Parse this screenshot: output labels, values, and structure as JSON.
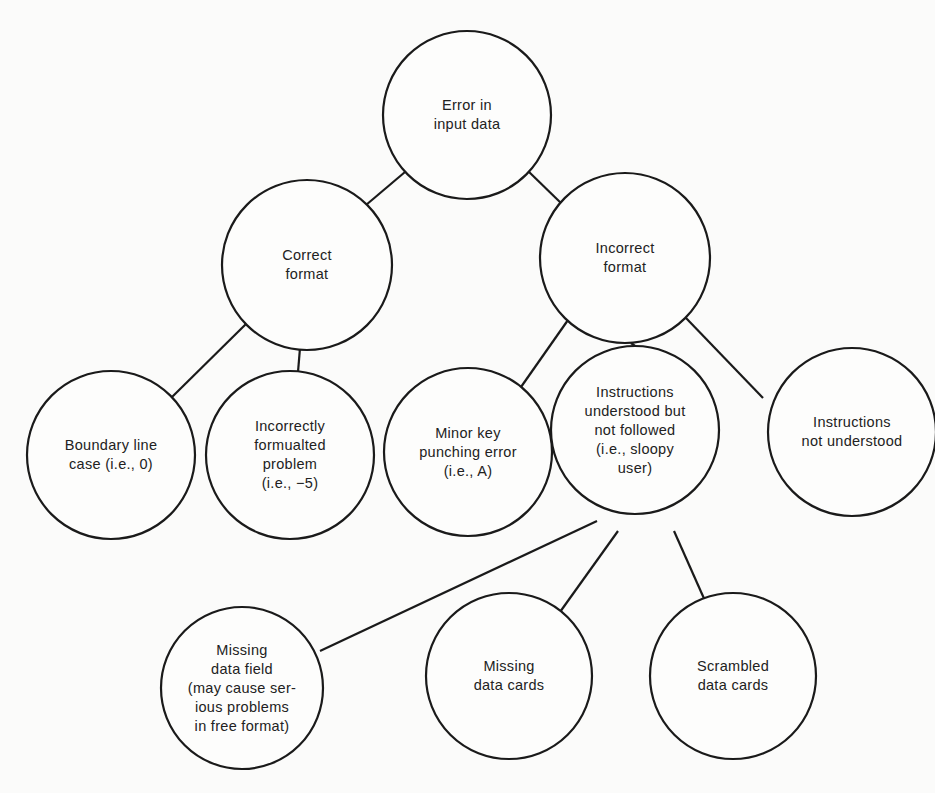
{
  "diagram": {
    "type": "tree",
    "root": "n0",
    "nodes": [
      {
        "id": "n0",
        "lines": [
          "Error in",
          "input data"
        ],
        "cx": 467,
        "cy": 115,
        "r": 84
      },
      {
        "id": "n1",
        "lines": [
          "Correct",
          "format"
        ],
        "cx": 307,
        "cy": 265,
        "r": 85
      },
      {
        "id": "n2",
        "lines": [
          "Incorrect",
          "format"
        ],
        "cx": 625,
        "cy": 258,
        "r": 85
      },
      {
        "id": "n3",
        "lines": [
          "Boundary line",
          "case (i.e., 0)"
        ],
        "cx": 111,
        "cy": 455,
        "r": 84
      },
      {
        "id": "n4",
        "lines": [
          "Incorrectly",
          "formualted",
          "problem",
          "(i.e., −5)"
        ],
        "cx": 290,
        "cy": 455,
        "r": 84
      },
      {
        "id": "n5",
        "lines": [
          "Minor key",
          "punching error",
          "(i.e., A)"
        ],
        "cx": 468,
        "cy": 452,
        "r": 84
      },
      {
        "id": "n6",
        "lines": [
          "Instructions",
          "understood but",
          "not followed",
          "(i.e., sloopy",
          "user)"
        ],
        "cx": 635,
        "cy": 430,
        "r": 84
      },
      {
        "id": "n7",
        "lines": [
          "Instructions",
          "not understood"
        ],
        "cx": 852,
        "cy": 432,
        "r": 84
      },
      {
        "id": "n8",
        "lines": [
          "Missing",
          "data field",
          "(may cause ser-",
          "ious problems",
          "in free format)"
        ],
        "cx": 242,
        "cy": 688,
        "r": 81
      },
      {
        "id": "n9",
        "lines": [
          "Missing",
          "data cards"
        ],
        "cx": 509,
        "cy": 676,
        "r": 83
      },
      {
        "id": "n10",
        "lines": [
          "Scrambled",
          "data cards"
        ],
        "cx": 733,
        "cy": 676,
        "r": 83
      }
    ],
    "edges": [
      {
        "from": "n0",
        "to": "n1",
        "x1": 405,
        "y1": 172,
        "x2": 366,
        "y2": 205
      },
      {
        "from": "n0",
        "to": "n2",
        "x1": 527,
        "y1": 170,
        "x2": 563,
        "y2": 205
      },
      {
        "from": "n1",
        "to": "n3",
        "x1": 247,
        "y1": 323,
        "x2": 172,
        "y2": 397
      },
      {
        "from": "n1",
        "to": "n4",
        "x1": 300,
        "y1": 348,
        "x2": 298,
        "y2": 372
      },
      {
        "from": "n2",
        "to": "n5",
        "x1": 568,
        "y1": 320,
        "x2": 521,
        "y2": 387
      },
      {
        "from": "n2",
        "to": "n6",
        "x1": 631,
        "y1": 343,
        "x2": 635,
        "y2": 346
      },
      {
        "from": "n2",
        "to": "n7",
        "x1": 686,
        "y1": 318,
        "x2": 763,
        "y2": 398
      },
      {
        "from": "n6",
        "to": "n8",
        "x1": 597,
        "y1": 521,
        "x2": 320,
        "y2": 651
      },
      {
        "from": "n6",
        "to": "n9",
        "x1": 618,
        "y1": 531,
        "x2": 560,
        "y2": 612
      },
      {
        "from": "n6",
        "to": "n10",
        "x1": 674,
        "y1": 531,
        "x2": 706,
        "y2": 603
      }
    ]
  }
}
